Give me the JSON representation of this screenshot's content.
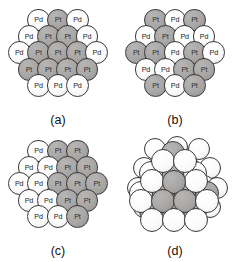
{
  "figure": {
    "background": "#ffffff",
    "width": 233,
    "height": 262,
    "species": {
      "pd": {
        "symbol": "Pd",
        "fill": "#fbfbfb",
        "stroke": "#3a3a3a"
      },
      "pt": {
        "symbol": "Pt",
        "fill": "#a9a7a5",
        "stroke": "#3a3a3a"
      }
    }
  },
  "panels": [
    {
      "id": "a",
      "label": "(a)",
      "description": "core-shell arrangement",
      "rows": [
        {
          "count": 3,
          "atoms": [
            "Pd",
            "Pt",
            "Pd"
          ]
        },
        {
          "count": 4,
          "atoms": [
            "Pd",
            "Pt",
            "Pt",
            "Pd"
          ]
        },
        {
          "count": 5,
          "atoms": [
            "Pd",
            "Pt",
            "Pt",
            "Pt",
            "Pd"
          ]
        },
        {
          "count": 4,
          "atoms": [
            "Pt",
            "Pt",
            "Pt",
            "Pt"
          ]
        },
        {
          "count": 3,
          "atoms": [
            "Pd",
            "Pd",
            "Pd"
          ]
        }
      ]
    },
    {
      "id": "b",
      "label": "(b)",
      "description": "random alloy arrangement",
      "rows": [
        {
          "count": 3,
          "atoms": [
            "Pt",
            "Pd",
            "Pt"
          ]
        },
        {
          "count": 4,
          "atoms": [
            "Pd",
            "Pt",
            "Pd",
            "Pd"
          ]
        },
        {
          "count": 5,
          "atoms": [
            "Pt",
            "Pt",
            "Pd",
            "Pt",
            "Pd"
          ]
        },
        {
          "count": 4,
          "atoms": [
            "Pd",
            "Pd",
            "Pt",
            "Pt"
          ]
        },
        {
          "count": 3,
          "atoms": [
            "Pt",
            "Pd",
            "Pt"
          ]
        }
      ]
    },
    {
      "id": "c",
      "label": "(c)",
      "description": "phase-separated arrangement",
      "rows": [
        {
          "count": 3,
          "atoms": [
            "Pd",
            "Pt",
            "Pt"
          ]
        },
        {
          "count": 4,
          "atoms": [
            "Pd",
            "Pd",
            "Pt",
            "Pt"
          ]
        },
        {
          "count": 5,
          "atoms": [
            "Pd",
            "Pd",
            "Pt",
            "Pt",
            "Pt"
          ]
        },
        {
          "count": 4,
          "atoms": [
            "Pd",
            "Pd",
            "Pt",
            "Pt"
          ]
        },
        {
          "count": 3,
          "atoms": [
            "Pd",
            "Pd",
            "Pt"
          ]
        }
      ]
    },
    {
      "id": "d",
      "label": "(d)",
      "description": "three-dimensional cluster, unlabeled atoms",
      "layers": [
        {
          "name": "back",
          "atoms": [
            {
              "x": 30,
              "y": 10,
              "r": 11,
              "species": "Pd"
            },
            {
              "x": 52,
              "y": 8,
              "r": 11,
              "species": "Pd"
            },
            {
              "x": 74,
              "y": 10,
              "r": 11,
              "species": "Pd"
            },
            {
              "x": 19,
              "y": 29,
              "r": 11,
              "species": "Pd"
            },
            {
              "x": 41,
              "y": 27,
              "r": 11,
              "species": "Pd"
            },
            {
              "x": 63,
              "y": 27,
              "r": 11,
              "species": "Pd"
            },
            {
              "x": 85,
              "y": 29,
              "r": 11,
              "species": "Pd"
            },
            {
              "x": 13,
              "y": 49,
              "r": 11,
              "species": "Pd"
            },
            {
              "x": 35,
              "y": 47,
              "r": 11,
              "species": "Pd"
            },
            {
              "x": 57,
              "y": 46,
              "r": 11,
              "species": "Pd"
            },
            {
              "x": 79,
              "y": 47,
              "r": 11,
              "species": "Pd"
            },
            {
              "x": 92,
              "y": 49,
              "r": 11,
              "species": "Pd"
            },
            {
              "x": 19,
              "y": 68,
              "r": 11,
              "species": "Pd"
            },
            {
              "x": 41,
              "y": 67,
              "r": 11,
              "species": "Pd"
            },
            {
              "x": 63,
              "y": 67,
              "r": 11,
              "species": "Pd"
            },
            {
              "x": 85,
              "y": 68,
              "r": 11,
              "species": "Pd"
            }
          ]
        },
        {
          "name": "middle",
          "atoms": [
            {
              "x": 48,
              "y": 14,
              "r": 12,
              "species": "Pt"
            },
            {
              "x": 26,
              "y": 34,
              "r": 12,
              "species": "Pd"
            },
            {
              "x": 48,
              "y": 33,
              "r": 12,
              "species": "Pt"
            },
            {
              "x": 70,
              "y": 34,
              "r": 12,
              "species": "Pd"
            },
            {
              "x": 16,
              "y": 54,
              "r": 12,
              "species": "Pd"
            },
            {
              "x": 38,
              "y": 53,
              "r": 12,
              "species": "Pt"
            },
            {
              "x": 60,
              "y": 52,
              "r": 12,
              "species": "Pt"
            },
            {
              "x": 82,
              "y": 54,
              "r": 12,
              "species": "Pt"
            },
            {
              "x": 26,
              "y": 72,
              "r": 12,
              "species": "Pt"
            },
            {
              "x": 48,
              "y": 71,
              "r": 12,
              "species": "Pt"
            },
            {
              "x": 70,
              "y": 72,
              "r": 12,
              "species": "Pt"
            }
          ]
        },
        {
          "name": "front",
          "atoms": [
            {
              "x": 38,
              "y": 22,
              "r": 12,
              "species": "Pd"
            },
            {
              "x": 60,
              "y": 22,
              "r": 12,
              "species": "Pd"
            },
            {
              "x": 27,
              "y": 42,
              "r": 12,
              "species": "Pd"
            },
            {
              "x": 49,
              "y": 43,
              "r": 12,
              "species": "Pt"
            },
            {
              "x": 71,
              "y": 42,
              "r": 12,
              "species": "Pd"
            },
            {
              "x": 16,
              "y": 62,
              "r": 12,
              "species": "Pd"
            },
            {
              "x": 38,
              "y": 62,
              "r": 12,
              "species": "Pt"
            },
            {
              "x": 60,
              "y": 62,
              "r": 12,
              "species": "Pt"
            },
            {
              "x": 82,
              "y": 62,
              "r": 12,
              "species": "Pd"
            },
            {
              "x": 27,
              "y": 81,
              "r": 12,
              "species": "Pd"
            },
            {
              "x": 49,
              "y": 81,
              "r": 12,
              "species": "Pd"
            },
            {
              "x": 71,
              "y": 81,
              "r": 12,
              "species": "Pd"
            }
          ]
        }
      ]
    }
  ]
}
